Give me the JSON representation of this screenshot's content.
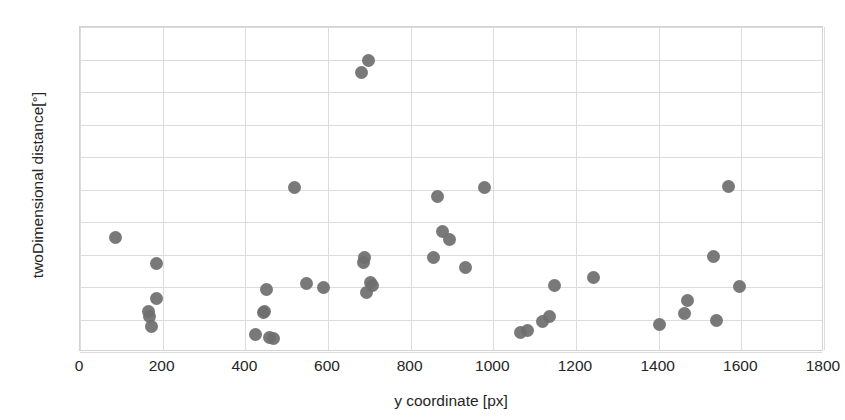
{
  "chart_data": {
    "type": "scatter",
    "title": "",
    "xlabel": "y coordinate [px]",
    "ylabel": "twoDimensional distance[°]",
    "xlim": [
      0,
      1800
    ],
    "ylim": [
      0,
      5
    ],
    "xticks": [
      "0",
      "200",
      "400",
      "600",
      "800",
      "1000",
      "1200",
      "1400",
      "1600",
      "1800"
    ],
    "xtick_values": [
      0,
      200,
      400,
      600,
      800,
      1000,
      1200,
      1400,
      1600,
      1800
    ],
    "yticks": [
      "0",
      "0,5",
      "1",
      "1,5",
      "2",
      "2,5",
      "3",
      "3,5",
      "4",
      "4,5",
      "5"
    ],
    "ytick_values": [
      0,
      0.5,
      1,
      1.5,
      2,
      2.5,
      3,
      3.5,
      4,
      4.5,
      5
    ],
    "grid": true,
    "legend": "none",
    "marker_color": "#6f6f6f",
    "marker_size": 13,
    "points": [
      {
        "x": 85,
        "y": 1.76
      },
      {
        "x": 165,
        "y": 0.62
      },
      {
        "x": 168,
        "y": 0.54
      },
      {
        "x": 172,
        "y": 0.4
      },
      {
        "x": 186,
        "y": 1.36
      },
      {
        "x": 186,
        "y": 0.82
      },
      {
        "x": 424,
        "y": 0.27
      },
      {
        "x": 444,
        "y": 0.61
      },
      {
        "x": 447,
        "y": 0.63
      },
      {
        "x": 452,
        "y": 0.96
      },
      {
        "x": 458,
        "y": 0.22
      },
      {
        "x": 468,
        "y": 0.21
      },
      {
        "x": 518,
        "y": 2.53
      },
      {
        "x": 548,
        "y": 1.05
      },
      {
        "x": 588,
        "y": 0.99
      },
      {
        "x": 681,
        "y": 4.3
      },
      {
        "x": 686,
        "y": 1.38
      },
      {
        "x": 688,
        "y": 1.46
      },
      {
        "x": 692,
        "y": 0.92
      },
      {
        "x": 698,
        "y": 4.48
      },
      {
        "x": 703,
        "y": 1.07
      },
      {
        "x": 707,
        "y": 1.02
      },
      {
        "x": 855,
        "y": 1.45
      },
      {
        "x": 866,
        "y": 2.4
      },
      {
        "x": 878,
        "y": 1.86
      },
      {
        "x": 893,
        "y": 1.73
      },
      {
        "x": 932,
        "y": 1.3
      },
      {
        "x": 978,
        "y": 2.53
      },
      {
        "x": 1066,
        "y": 0.3
      },
      {
        "x": 1082,
        "y": 0.33
      },
      {
        "x": 1120,
        "y": 0.47
      },
      {
        "x": 1136,
        "y": 0.54
      },
      {
        "x": 1147,
        "y": 1.02
      },
      {
        "x": 1242,
        "y": 1.14
      },
      {
        "x": 1401,
        "y": 0.42
      },
      {
        "x": 1463,
        "y": 0.6
      },
      {
        "x": 1470,
        "y": 0.79
      },
      {
        "x": 1533,
        "y": 1.47
      },
      {
        "x": 1540,
        "y": 0.49
      },
      {
        "x": 1570,
        "y": 2.54
      },
      {
        "x": 1596,
        "y": 1.01
      }
    ]
  }
}
